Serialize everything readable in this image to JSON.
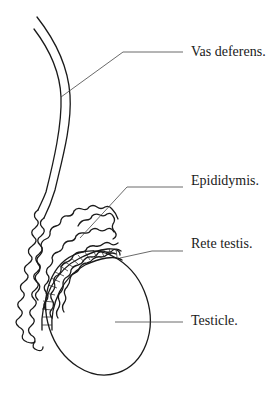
{
  "diagram": {
    "labels": [
      {
        "id": "vas-deferens",
        "text": "Vas deferens."
      },
      {
        "id": "epididymis",
        "text": "Epididymis."
      },
      {
        "id": "rete-testis",
        "text": "Rete testis."
      },
      {
        "id": "testicle",
        "text": "Testicle."
      }
    ]
  }
}
